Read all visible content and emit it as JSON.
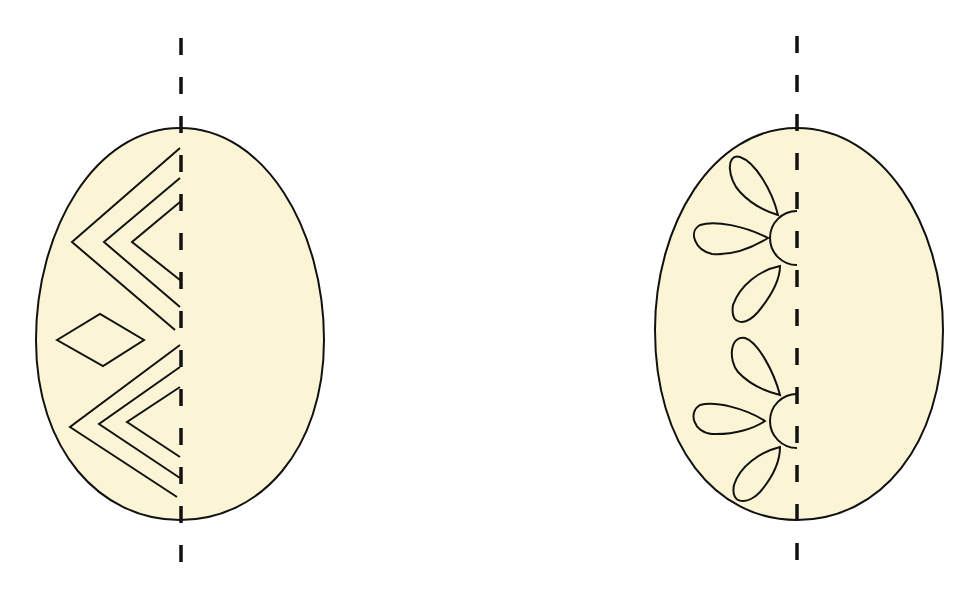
{
  "colors": {
    "egg_fill": "#fcf5d5",
    "stroke": "#111111",
    "background": "#ffffff"
  },
  "figures": [
    {
      "id": "egg-left",
      "pattern": "chevrons-and-diamond",
      "axis": "vertical dashed line",
      "motifs": [
        "nested chevron group (top)",
        "diamond",
        "nested chevron group (bottom)"
      ]
    },
    {
      "id": "egg-right",
      "pattern": "half-flowers",
      "axis": "vertical dashed line",
      "motifs": [
        "half flower with 3 petals (top)",
        "half flower with 3 petals (bottom)"
      ]
    }
  ]
}
